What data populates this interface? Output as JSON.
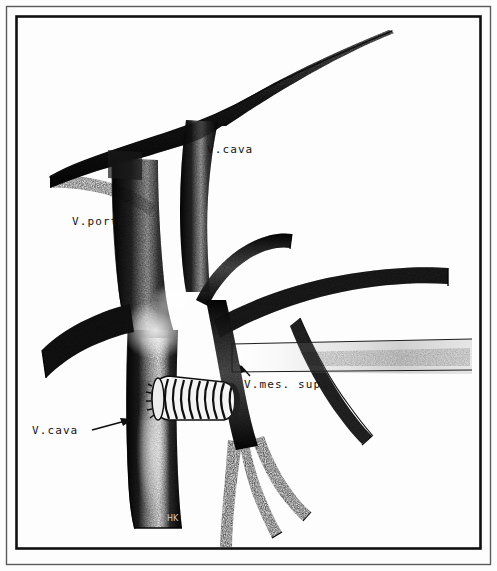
{
  "figure": {
    "medium": "stipple airbrush line drawing",
    "background_color": "#fdfdfd",
    "ink_color": "#111111",
    "frame": {
      "outer_color": "#4a4a4a",
      "inner_color": "#111111",
      "outer_rect": [
        6,
        6,
        485,
        559
      ],
      "inner_rect": [
        16,
        16,
        465,
        533
      ]
    },
    "signature": "HK"
  },
  "labels": [
    {
      "id": "vcava-top",
      "text": "V.cava",
      "x": 207,
      "y": 144,
      "structure": "inferior vena cava, suprarenal segment"
    },
    {
      "id": "vporta",
      "text": "V.porta",
      "x": 72,
      "y": 216,
      "structure": "portal vein"
    },
    {
      "id": "vmes-sup",
      "text": "V.mes. sup.",
      "x": 244,
      "y": 379,
      "structure": "superior mesenteric vein"
    },
    {
      "id": "vcava-bottom",
      "text": "V.cava",
      "x": 32,
      "y": 425,
      "structure": "inferior vena cava, infrarenal segment"
    }
  ],
  "leaders": [
    {
      "id": "vcava-bottom-arrow",
      "from": [
        92,
        429
      ],
      "to": [
        133,
        421
      ],
      "points_to": "inferior vena cava trunk"
    },
    {
      "id": "vmes-arrow",
      "from": [
        250,
        375
      ],
      "to": [
        240,
        365
      ],
      "points_to": "superior mesenteric vein confluence"
    }
  ],
  "structures": [
    {
      "name": "vena-cava-superior-segment",
      "kind": "vessel",
      "description": "broad stippled vessel sweeping from upper right down to the left margin"
    },
    {
      "name": "portal-vein",
      "kind": "vessel",
      "description": "vertical trunk descending from the cava confluence"
    },
    {
      "name": "inferior-vena-cava-trunk",
      "kind": "vessel",
      "description": "wide vertical trunk running to the lower border of the frame"
    },
    {
      "name": "renal-vein-left",
      "kind": "vessel",
      "description": "horizontal branch extending to the left border"
    },
    {
      "name": "splenic-vein",
      "kind": "vessel",
      "description": "vessel extending to the right margin"
    },
    {
      "name": "superior-mesenteric-vein",
      "kind": "vessel",
      "description": "vessel descending to the right of the cava with three tributaries"
    },
    {
      "name": "mesenteric-tributaries",
      "kind": "vessel",
      "description": "three slender branches descending from the mesenteric trunk"
    },
    {
      "name": "duodenum-band",
      "kind": "organ-outline",
      "description": "pale horizontal band outlined by two thin lines crossing to the right margin"
    },
    {
      "name": "ringed-graft",
      "kind": "prosthesis",
      "description": "externally supported ringed vascular graft bridging cava and mesenteric vein",
      "ring_count": 17
    }
  ]
}
